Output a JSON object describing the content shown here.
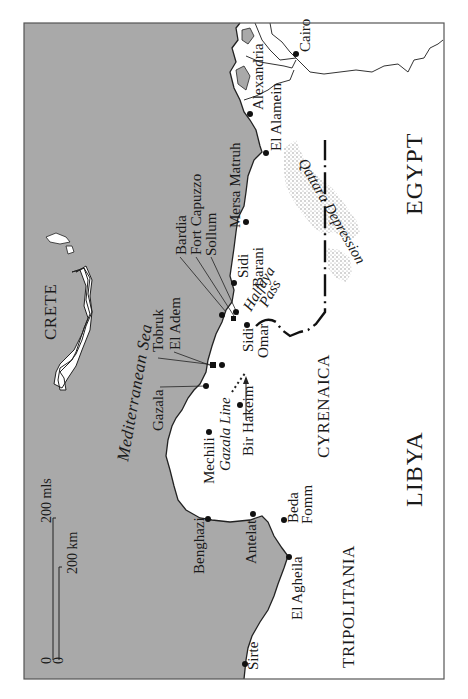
{
  "map": {
    "orientation": "rotated 90 degrees counter-clockwise (north to the left)",
    "colors": {
      "sea": "#a9a9a9",
      "land": "#ffffff",
      "coast": "#222222",
      "depression": "#b8b8b8",
      "frame": "#555555"
    },
    "sea_label": "Mediterranean Sea",
    "island_label": "CRETE",
    "countries": {
      "egypt": "EGYPT",
      "libya": "LIBYA"
    },
    "regions": {
      "cyrenaica": "CYRENAICA",
      "tripolitania": "TRIPOLITANIA"
    },
    "features": {
      "qattara": "Qattara Depression",
      "halfaya": "Halfaya",
      "halfaya_pass": "Pass",
      "gazala_line": "Gazala Line"
    },
    "places": {
      "cairo": "Cairo",
      "alexandria": "Alexandria",
      "el_alamein": "El Alamein",
      "mersa_matruh": "Mersa Matruh",
      "sidi": "Sidi",
      "barani": "Barani",
      "omar": "Omar",
      "bardia": "Bardia",
      "fort_capuzzo": "Fort Capuzzo",
      "sollum": "Sollum",
      "tobruk": "Tobruk",
      "el_adem": "El Adem",
      "gazala": "Gazala",
      "mechili": "Mechili",
      "bir_hakeim": "Bir Hakeim",
      "benghazi": "Benghazi",
      "antelat": "Antelat",
      "beda": "Beda",
      "fomm": "Fomm",
      "el_agheila": "El Agheila",
      "sirte": "Sirte"
    },
    "scale": {
      "zero_mls": "0",
      "zero_km": "0",
      "miles": "200 mls",
      "km": "200 km"
    }
  }
}
